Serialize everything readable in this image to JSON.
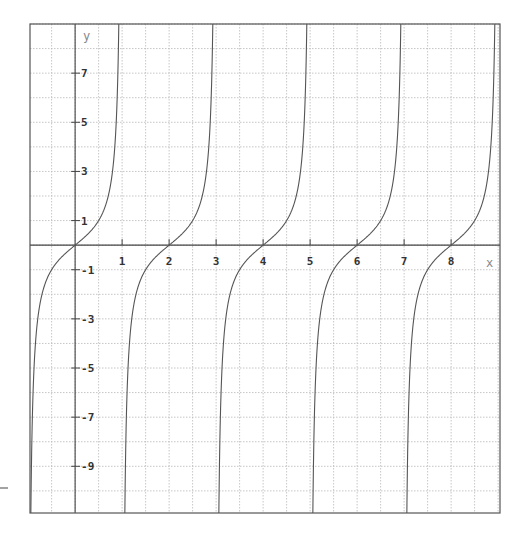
{
  "chart_data": {
    "type": "line",
    "title": "",
    "function": "y = tan(pi*x/2)",
    "xlabel": "x",
    "ylabel": "y",
    "xlim": [
      -0.96,
      9.04
    ],
    "ylim": [
      -10.9,
      9.0
    ],
    "grid": true,
    "grid_style": "dotted",
    "x_grid_step": 0.5,
    "y_grid_step": 1,
    "x_ticks": [
      1,
      2,
      3,
      4,
      5,
      6,
      7,
      8
    ],
    "x_tick_labels": [
      "1",
      "2",
      "3",
      "4",
      "5",
      "6",
      "7",
      "8"
    ],
    "y_ticks": [
      7,
      5,
      3,
      1,
      -1,
      -3,
      -5,
      -7,
      -9
    ],
    "y_tick_labels": [
      "7",
      "5",
      "3",
      "1",
      "-1",
      "-3",
      "-5",
      "-7",
      "-9"
    ],
    "zeros": [
      0,
      2,
      4,
      6,
      8
    ],
    "asymptotes": [
      -1,
      1,
      3,
      5,
      7,
      9
    ],
    "series": [
      {
        "name": "tan(pi*x/2)",
        "color": "#555555",
        "x": [
          -0.9,
          -0.75,
          -0.5,
          -0.25,
          0,
          0.25,
          0.5,
          0.75,
          0.9,
          1.1,
          1.25,
          1.5,
          1.75,
          2,
          2.25,
          2.5,
          2.75,
          2.9,
          3.1,
          3.5,
          4,
          4.5,
          4.9,
          5.1,
          5.5,
          6,
          6.5,
          6.9,
          7.1,
          7.5,
          8,
          8.5,
          8.9
        ],
        "y": [
          -6.31,
          -2.41,
          -1,
          -0.41,
          0,
          0.41,
          1,
          2.41,
          6.31,
          -6.31,
          -2.41,
          -1,
          -0.41,
          0,
          0.41,
          1,
          2.41,
          6.31,
          -6.31,
          -1,
          0,
          1,
          6.31,
          -6.31,
          -1,
          0,
          1,
          6.31,
          -6.31,
          -1,
          0,
          1,
          6.31
        ]
      }
    ],
    "legend": null
  },
  "colors": {
    "background": "#ffffff",
    "frame": "#555555",
    "grid": "#b8b8b8",
    "curve": "#555555",
    "tick_label": "#333333",
    "axis_label": "#888888"
  }
}
